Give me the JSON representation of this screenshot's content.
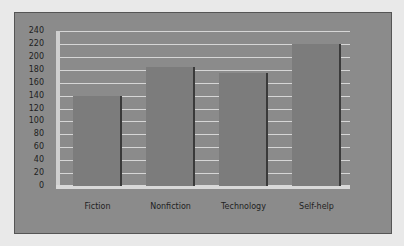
{
  "chart_data": {
    "type": "bar",
    "title": "",
    "xlabel": "",
    "ylabel": "",
    "categories": [
      "Fiction",
      "Nonfiction",
      "Technology",
      "Self-help"
    ],
    "values": [
      140,
      185,
      175,
      220
    ],
    "ylim": [
      0,
      240
    ],
    "yticks": [
      0,
      20,
      40,
      60,
      80,
      100,
      120,
      140,
      160,
      180,
      200,
      220,
      240
    ],
    "grid": true,
    "legend": null
  },
  "colors": {
    "background": "#8b8b8b",
    "bar": "#7c7c7c",
    "gridline": "#d6d6d6"
  }
}
